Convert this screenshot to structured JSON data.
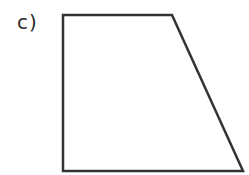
{
  "figure": {
    "label": "c)",
    "shape": "trapezoid",
    "stroke_color": "#333333",
    "fill_color": "#ffffff",
    "vertices": {
      "top_left": [
        63,
        15
      ],
      "top_right": [
        172,
        15
      ],
      "bottom_right": [
        243,
        171
      ],
      "bottom_left": [
        63,
        171
      ]
    }
  }
}
